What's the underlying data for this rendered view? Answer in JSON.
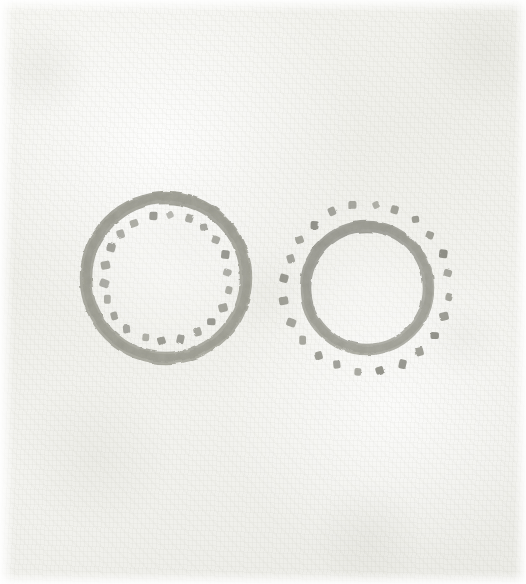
{
  "image": {
    "title": "Two Dotted Ring Motifs",
    "medium_note": "faded hand-drawn ink on aged paper",
    "width": 526,
    "height": 584,
    "background_color": "#f2f2ee",
    "ink_color": "#8b8b80",
    "ink_color_dark": "#76766b",
    "ink_color_light": "#a3a399"
  },
  "figures": [
    {
      "id": "left-ring",
      "name": "dotted-ring-inner-dots",
      "description": "Thick hand-drawn ring with a circle of small square dots placed inside it",
      "center_x": 166,
      "center_y": 278,
      "ring_outer_radius": 86,
      "ring_stroke_width": 12,
      "dot_ring_radius": 63,
      "dot_count": 22,
      "dot_size": 8,
      "dot_placement": "inside"
    },
    {
      "id": "right-ring",
      "name": "dotted-ring-outer-dots",
      "description": "Thick hand-drawn ring with a circle of small square dots placed outside it",
      "center_x": 367,
      "center_y": 288,
      "ring_outer_radius": 67,
      "ring_stroke_width": 11,
      "dot_ring_radius": 83,
      "dot_count": 24,
      "dot_size": 8,
      "dot_placement": "outside"
    }
  ]
}
